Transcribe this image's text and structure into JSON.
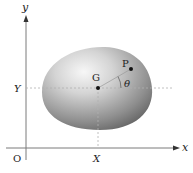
{
  "diagram": {
    "axes": {
      "x_label": "x",
      "y_label": "y",
      "origin_label": "O",
      "X_tick_label": "X",
      "Y_tick_label": "Y"
    },
    "points": {
      "centroid_label": "G",
      "point_label": "P",
      "angle_label": "θ"
    },
    "colors": {
      "axis": "#7a7a7a",
      "dashed": "#b0b0b0",
      "body_light": "#f4f4f4",
      "body_dark": "#6e6e6e",
      "text": "#222222"
    }
  }
}
